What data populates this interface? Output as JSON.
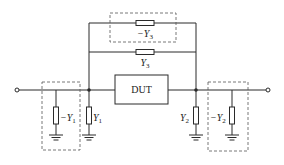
{
  "diagram": {
    "type": "circuit",
    "dut_label": "DUT",
    "labels": {
      "neg_y3": {
        "sign": "−",
        "sym": "Y",
        "sub": "3"
      },
      "y3": {
        "sign": "",
        "sym": "Y",
        "sub": "3"
      },
      "y1": {
        "sign": "",
        "sym": "Y",
        "sub": "1"
      },
      "neg_y1": {
        "sign": "−",
        "sym": "Y",
        "sub": "1"
      },
      "y2": {
        "sign": "",
        "sym": "Y",
        "sub": "2"
      },
      "neg_y2": {
        "sign": "−",
        "sym": "Y",
        "sub": "2"
      }
    },
    "colors": {
      "line": "#2a2a2a",
      "dashed": "#555555",
      "background": "#ffffff"
    }
  }
}
